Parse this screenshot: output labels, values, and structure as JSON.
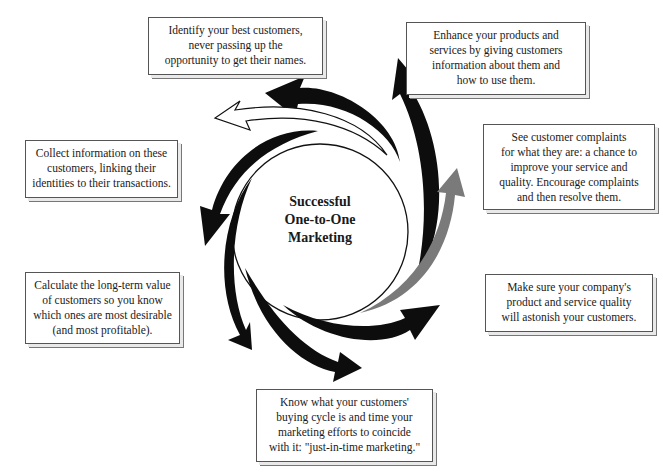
{
  "diagram": {
    "center": {
      "lines": [
        "Successful",
        "One-to-One",
        "Marketing"
      ]
    },
    "boxes": [
      {
        "id": "identify",
        "lines": [
          "Identify your best customers,",
          "never passing up the",
          "opportunity to get their names."
        ]
      },
      {
        "id": "enhance",
        "lines": [
          "Enhance your products and",
          "services by giving customers",
          "information about them and",
          "how to use them."
        ]
      },
      {
        "id": "complaints",
        "lines": [
          "See customer complaints",
          "for what they are: a chance to",
          "improve your service and",
          "quality. Encourage complaints",
          "and then resolve them."
        ]
      },
      {
        "id": "quality",
        "lines": [
          "Make sure your company's",
          "product and service quality",
          "will astonish your customers."
        ]
      },
      {
        "id": "buying-cycle",
        "lines": [
          "Know what your customers'",
          "buying cycle is and time your",
          "marketing efforts to coincide",
          "with it: \"just-in-time marketing.\""
        ]
      },
      {
        "id": "lifetime-value",
        "lines": [
          "Calculate the long-term value",
          "of customers so you know",
          "which ones are most desirable",
          "(and most profitable)."
        ]
      },
      {
        "id": "collect",
        "lines": [
          "Collect information on these",
          "customers, linking their",
          "identities to their transactions."
        ]
      }
    ],
    "arrow_colors": {
      "black": "#0d0d0d",
      "gray": "#7a7a7a",
      "outline": "#ffffff"
    }
  }
}
